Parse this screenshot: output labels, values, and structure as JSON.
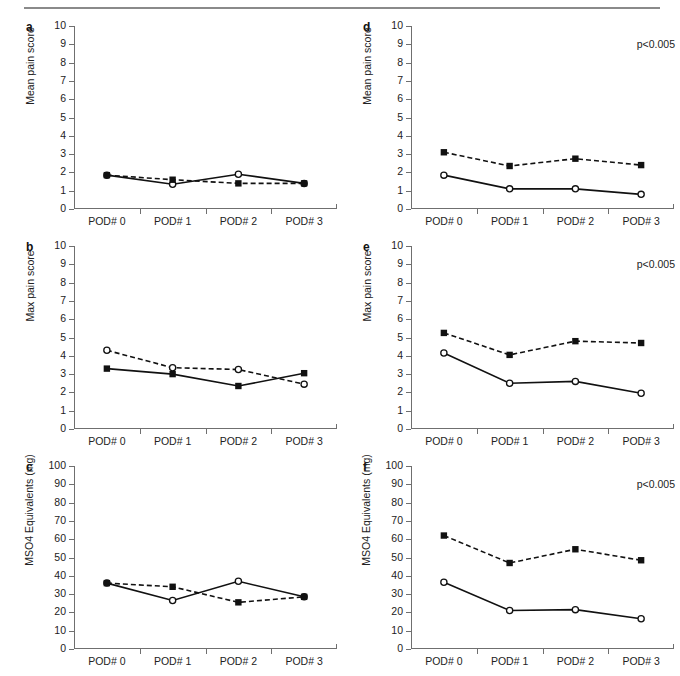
{
  "figure": {
    "x_categories": [
      "POD# 0",
      "POD# 1",
      "POD# 2",
      "POD# 3"
    ],
    "significance_label": "p<0.005",
    "series_styles": {
      "open_circle": "open-circle-marker",
      "filled_square": "filled-square-marker"
    }
  },
  "panels": [
    {
      "letter": "a",
      "ylabel": "Mean pain score",
      "pvalue": "",
      "chart_data": {
        "type": "line",
        "title": "",
        "xlabel": "",
        "ylabel": "Mean pain score",
        "categories": [
          "POD# 0",
          "POD# 1",
          "POD# 2",
          "POD# 3"
        ],
        "ylim": [
          0,
          10
        ],
        "yticks": [
          0,
          1,
          2,
          3,
          4,
          5,
          6,
          7,
          8,
          9,
          10
        ],
        "grid": false,
        "legend": "none",
        "series": [
          {
            "name": "solid-open-circle",
            "style": "solid",
            "marker": "open-circle",
            "values": [
              1.85,
              1.35,
              1.9,
              1.4
            ]
          },
          {
            "name": "dashed-filled-square",
            "style": "dashed",
            "marker": "filled-square",
            "values": [
              1.85,
              1.6,
              1.4,
              1.4
            ]
          }
        ]
      }
    },
    {
      "letter": "b",
      "ylabel": "Max pain score",
      "pvalue": "",
      "chart_data": {
        "type": "line",
        "title": "",
        "xlabel": "",
        "ylabel": "Max pain score",
        "categories": [
          "POD# 0",
          "POD# 1",
          "POD# 2",
          "POD# 3"
        ],
        "ylim": [
          0,
          10
        ],
        "yticks": [
          0,
          1,
          2,
          3,
          4,
          5,
          6,
          7,
          8,
          9,
          10
        ],
        "grid": false,
        "legend": "none",
        "series": [
          {
            "name": "solid-filled-square",
            "style": "solid",
            "marker": "filled-square",
            "values": [
              3.3,
              3.0,
              2.35,
              3.05
            ]
          },
          {
            "name": "dashed-open-circle",
            "style": "dashed",
            "marker": "open-circle",
            "values": [
              4.3,
              3.35,
              3.25,
              2.45
            ]
          }
        ]
      }
    },
    {
      "letter": "c",
      "ylabel": "MSO4 Equivalents (mg)",
      "pvalue": "",
      "chart_data": {
        "type": "line",
        "title": "",
        "xlabel": "",
        "ylabel": "MSO4 Equivalents (mg)",
        "categories": [
          "POD# 0",
          "POD# 1",
          "POD# 2",
          "POD# 3"
        ],
        "ylim": [
          0,
          100
        ],
        "yticks": [
          0,
          10,
          20,
          30,
          40,
          50,
          60,
          70,
          80,
          90,
          100
        ],
        "grid": false,
        "legend": "none",
        "series": [
          {
            "name": "solid-open-circle",
            "style": "solid",
            "marker": "open-circle",
            "values": [
              36.0,
              26.5,
              37.0,
              28.5
            ]
          },
          {
            "name": "dashed-filled-square",
            "style": "dashed",
            "marker": "filled-square",
            "values": [
              36.0,
              34.0,
              25.5,
              28.5
            ]
          }
        ]
      }
    },
    {
      "letter": "d",
      "ylabel": "Mean pain score",
      "pvalue": "p<0.005",
      "chart_data": {
        "type": "line",
        "title": "",
        "xlabel": "",
        "ylabel": "Mean pain score",
        "categories": [
          "POD# 0",
          "POD# 1",
          "POD# 2",
          "POD# 3"
        ],
        "ylim": [
          0,
          10
        ],
        "yticks": [
          0,
          1,
          2,
          3,
          4,
          5,
          6,
          7,
          8,
          9,
          10
        ],
        "grid": false,
        "legend": "none",
        "annotations": [
          "p<0.005"
        ],
        "series": [
          {
            "name": "dashed-filled-square",
            "style": "dashed",
            "marker": "filled-square",
            "values": [
              3.1,
              2.35,
              2.75,
              2.4
            ]
          },
          {
            "name": "solid-open-circle",
            "style": "solid",
            "marker": "open-circle",
            "values": [
              1.85,
              1.1,
              1.1,
              0.8
            ]
          }
        ]
      }
    },
    {
      "letter": "e",
      "ylabel": "Max pain score",
      "pvalue": "p<0.005",
      "chart_data": {
        "type": "line",
        "title": "",
        "xlabel": "",
        "ylabel": "Max pain score",
        "categories": [
          "POD# 0",
          "POD# 1",
          "POD# 2",
          "POD# 3"
        ],
        "ylim": [
          0,
          10
        ],
        "yticks": [
          0,
          1,
          2,
          3,
          4,
          5,
          6,
          7,
          8,
          9,
          10
        ],
        "grid": false,
        "legend": "none",
        "annotations": [
          "p<0.005"
        ],
        "series": [
          {
            "name": "dashed-filled-square",
            "style": "dashed",
            "marker": "filled-square",
            "values": [
              5.25,
              4.05,
              4.8,
              4.7
            ]
          },
          {
            "name": "solid-open-circle",
            "style": "solid",
            "marker": "open-circle",
            "values": [
              4.15,
              2.5,
              2.6,
              1.95
            ]
          }
        ]
      }
    },
    {
      "letter": "f",
      "ylabel": "MSO4 Equivalents (mg)",
      "pvalue": "p<0.005",
      "chart_data": {
        "type": "line",
        "title": "",
        "xlabel": "",
        "ylabel": "MSO4 Equivalents (mg)",
        "categories": [
          "POD# 0",
          "POD# 1",
          "POD# 2",
          "POD# 3"
        ],
        "ylim": [
          0,
          100
        ],
        "yticks": [
          0,
          10,
          20,
          30,
          40,
          50,
          60,
          70,
          80,
          90,
          100
        ],
        "grid": false,
        "legend": "none",
        "annotations": [
          "p<0.005"
        ],
        "series": [
          {
            "name": "dashed-filled-square",
            "style": "dashed",
            "marker": "filled-square",
            "values": [
              62.0,
              47.0,
              54.5,
              48.5
            ]
          },
          {
            "name": "solid-open-circle",
            "style": "solid",
            "marker": "open-circle",
            "values": [
              36.5,
              21.0,
              21.5,
              16.5
            ]
          }
        ]
      }
    }
  ]
}
